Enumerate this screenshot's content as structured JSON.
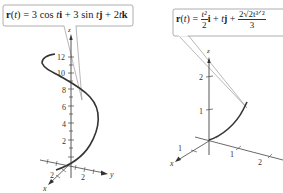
{
  "figures": [
    {
      "id": "left",
      "equation_label": "r(t) = 3 cos ti + 3 sin tj + 2tk",
      "equation_parts": {
        "lhs": "r",
        "var": "t",
        "rhs": "= 3 cos t i + 3 sin t j + 2t k"
      },
      "axes": {
        "z": "z",
        "x": "x",
        "y": "y"
      },
      "z_ticks": [
        "12",
        "10",
        "8",
        "6",
        "4",
        "2"
      ],
      "x_ticks": [
        "2"
      ],
      "y_ticks": [
        "2"
      ],
      "curve": "helix"
    },
    {
      "id": "right",
      "equation_label": "r(t) = t^2/2 i + t j + (2√2 t^(3/2))/3",
      "equation_parts": {
        "lhs": "r",
        "var": "t",
        "frac1_num": "t²",
        "frac1_den": "2",
        "mid": "i + tj +",
        "frac2_num": "2√2t³ᐟ²",
        "frac2_den": "3"
      },
      "axes": {
        "z": "z",
        "x": "x",
        "y": "y"
      },
      "z_ticks": [
        "2",
        "1"
      ],
      "x_ticks": [
        "1"
      ],
      "y_ticks": [
        "1",
        "2"
      ],
      "curve": "space curve"
    }
  ]
}
